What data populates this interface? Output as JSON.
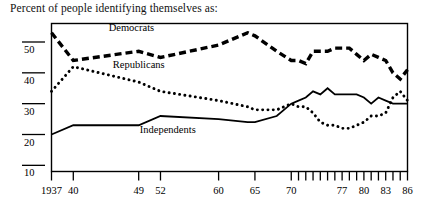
{
  "caption": "Percent of people identifying themselves as:",
  "chart_data": {
    "type": "line",
    "title": "Percent of people identifying themselves as:",
    "xlabel": "",
    "ylabel": "",
    "xlim": [
      1937,
      1986
    ],
    "ylim": [
      8,
      56
    ],
    "grid": false,
    "legend": "inline-annotations",
    "y_ticks": [
      10,
      20,
      30,
      40,
      50
    ],
    "y_tick_labels": [
      "10",
      "20",
      "30",
      "40",
      "50"
    ],
    "x_ticks": [
      1937,
      1940,
      1949,
      1952,
      1960,
      1965,
      1970,
      1971,
      1972,
      1973,
      1974,
      1975,
      1976,
      1977,
      1978,
      1979,
      1980,
      1981,
      1982,
      1983,
      1984,
      1985,
      1986
    ],
    "x_tick_labels": [
      "1937",
      "40",
      "49",
      "52",
      "60",
      "65",
      "70",
      "77",
      "80",
      "83",
      "86"
    ],
    "x_labeled_ticks": [
      1937,
      1940,
      1949,
      1952,
      1960,
      1965,
      1970,
      1977,
      1980,
      1983,
      1986
    ],
    "series": [
      {
        "name": "Democrats",
        "style": "dashed",
        "color": "#000000",
        "label_x": 1948,
        "label_y": 53.5,
        "x": [
          1937,
          1940,
          1949,
          1952,
          1960,
          1964,
          1965,
          1968,
          1970,
          1971,
          1972,
          1973,
          1974,
          1975,
          1976,
          1977,
          1978,
          1979,
          1980,
          1981,
          1982,
          1983,
          1984,
          1985,
          1986
        ],
        "values": [
          53,
          44,
          47,
          45,
          49,
          53,
          52,
          47,
          44,
          44,
          43,
          47,
          47,
          47,
          48,
          48,
          48,
          46,
          44,
          46,
          45,
          44,
          40,
          38,
          41
        ]
      },
      {
        "name": "Republicans",
        "style": "dotted",
        "color": "#000000",
        "label_x": 1949,
        "label_y": 41.5,
        "x": [
          1937,
          1940,
          1949,
          1952,
          1960,
          1964,
          1965,
          1968,
          1970,
          1971,
          1972,
          1973,
          1974,
          1975,
          1976,
          1977,
          1978,
          1979,
          1980,
          1981,
          1982,
          1983,
          1984,
          1985,
          1986
        ],
        "values": [
          34,
          42,
          37,
          34,
          31,
          29,
          28,
          28,
          30,
          29,
          29,
          27,
          24,
          23,
          23,
          22,
          22,
          23,
          24,
          26,
          26,
          27,
          32,
          34,
          31
        ]
      },
      {
        "name": "Independents",
        "style": "solid",
        "color": "#000000",
        "label_x": 1953,
        "label_y": 20.5,
        "x": [
          1937,
          1940,
          1949,
          1952,
          1960,
          1964,
          1965,
          1968,
          1970,
          1971,
          1972,
          1973,
          1974,
          1975,
          1976,
          1977,
          1978,
          1979,
          1980,
          1981,
          1982,
          1983,
          1984,
          1985,
          1986
        ],
        "values": [
          20,
          23,
          23,
          26,
          25,
          24,
          24,
          26,
          30,
          31,
          32,
          34,
          33,
          35,
          33,
          33,
          33,
          33,
          32,
          30,
          32,
          31,
          30,
          30,
          30
        ]
      }
    ]
  }
}
